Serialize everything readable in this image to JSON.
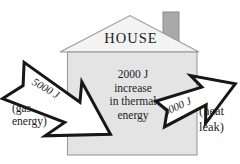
{
  "house": {
    "label": "HOUSE",
    "thermal_lines": [
      "2000 J",
      "increase",
      "in thermal",
      "energy"
    ]
  },
  "gas_arrow": {
    "value": "5000 J",
    "caption_lines": [
      "(gas",
      "energy)"
    ]
  },
  "heat_arrow": {
    "value": "3000 J",
    "caption_lines": [
      "(heat",
      "leak)"
    ]
  },
  "colors": {
    "background": "#ffffff",
    "house_body_fill": "#e4e4e4",
    "roof_fill": "#f3f3f3",
    "chimney_fill": "#a9a9a9",
    "house_outline": "#9a9a9a",
    "arrow_fill": "#ffffff",
    "arrow_outline": "#171717",
    "text": "#1c1c1c"
  }
}
